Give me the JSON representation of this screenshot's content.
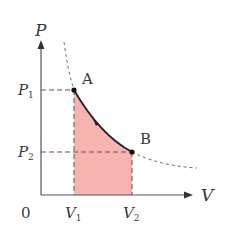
{
  "diagram": {
    "type": "pv-diagram",
    "axes": {
      "y_label": "P",
      "x_label": "V",
      "origin_label": "0"
    },
    "points": [
      {
        "name": "A",
        "pressure_label": "P",
        "pressure_sub": "1",
        "volume_label": "V",
        "volume_sub": "1"
      },
      {
        "name": "B",
        "pressure_label": "P",
        "pressure_sub": "2",
        "volume_label": "V",
        "volume_sub": "2"
      }
    ],
    "colors": {
      "axis": "#555555",
      "curve": "#222222",
      "dashed": "#666666",
      "fill": "#f6b3b0",
      "guide": "#7a4a4a"
    }
  }
}
